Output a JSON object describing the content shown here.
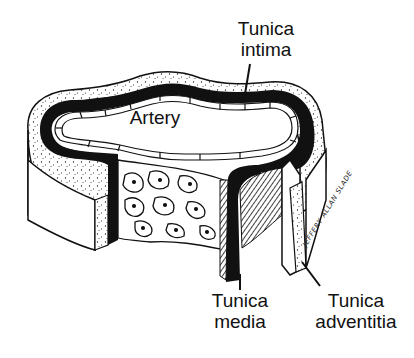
{
  "diagram": {
    "labels": {
      "tunica_intima": {
        "line1": "Tunica",
        "line2": "intima"
      },
      "artery": "Artery",
      "tunica_media": {
        "line1": "Tunica",
        "line2": "media"
      },
      "tunica_adventitia": {
        "line1": "Tunica",
        "line2": "adventitia"
      }
    },
    "signature": "JEFFERY ALLAN SLADE",
    "colors": {
      "ink": "#111111",
      "background": "#ffffff"
    }
  }
}
